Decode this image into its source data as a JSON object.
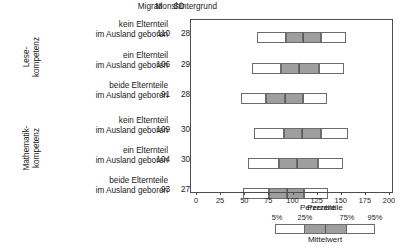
{
  "header": {
    "migration_label": "Migrationshintergrund",
    "m_label": "M",
    "sd_label": "SD"
  },
  "groups": [
    {
      "line1": "Lese-",
      "line2": "kompetenz"
    },
    {
      "line1": "Mathematik-",
      "line2": "kompetenz"
    }
  ],
  "rows": [
    {
      "line1": "kein Elternteil",
      "line2": "im Ausland geboren",
      "M": "110",
      "SD": "28"
    },
    {
      "line1": "ein Elternteil",
      "line2": "im Ausland geboren",
      "M": "106",
      "SD": "29"
    },
    {
      "line1": "beide Elternteile",
      "line2": "im Ausland geboren",
      "M": "91",
      "SD": "28"
    },
    {
      "line1": "kein Elternteil",
      "line2": "im Ausland geboren",
      "M": "109",
      "SD": "30"
    },
    {
      "line1": "ein Elternteil",
      "line2": "im Ausland geboren",
      "M": "104",
      "SD": "30"
    },
    {
      "line1": "beide Elternteile",
      "line2": "im Ausland geboren",
      "M": "93",
      "SD": "27"
    }
  ],
  "axis": {
    "title": "Perzentile",
    "ticks": [
      "0",
      "25",
      "50",
      "75",
      "100",
      "125",
      "150",
      "175",
      "200"
    ],
    "min": 0,
    "max": 200,
    "step": 25
  },
  "legend": {
    "title": "Perzentile",
    "mean_label": "Mittelwert",
    "percentile_labels": [
      "5%",
      "25%",
      "75%",
      "95%"
    ]
  },
  "colors": {
    "outer_fill": "#ffffff",
    "inner_fill": "#9e9e9e",
    "stroke": "#6b6b6b",
    "axis": "#4d4d4d",
    "text": "#1a1a1a"
  },
  "chart_data": {
    "type": "bar",
    "xlabel": "Perzentile",
    "ylabel": "",
    "xlim": [
      0,
      200
    ],
    "xticks": [
      0,
      25,
      50,
      75,
      100,
      125,
      150,
      175,
      200
    ],
    "grid": false,
    "legend": "bottom-right",
    "categories": [
      "Lesekompetenz / kein Elternteil im Ausland geboren",
      "Lesekompetenz / ein Elternteil im Ausland geboren",
      "Lesekompetenz / beide Elternteile im Ausland geboren",
      "Mathematikkompetenz / kein Elternteil im Ausland geboren",
      "Mathematikkompetenz / ein Elternteil im Ausland geboren",
      "Mathematikkompetenz / beide Elternteile im Ausland geboren"
    ],
    "series": [
      {
        "name": "M",
        "values": [
          110,
          106,
          91,
          109,
          104,
          93
        ]
      },
      {
        "name": "SD",
        "values": [
          28,
          29,
          28,
          30,
          30,
          27
        ]
      },
      {
        "name": "p5",
        "values": [
          62,
          57,
          46,
          59,
          53,
          48
        ]
      },
      {
        "name": "p25",
        "values": [
          92,
          87,
          72,
          90,
          85,
          75
        ]
      },
      {
        "name": "p75",
        "values": [
          129,
          126,
          110,
          129,
          125,
          111
        ]
      },
      {
        "name": "p95",
        "values": [
          154,
          152,
          135,
          156,
          151,
          136
        ]
      }
    ],
    "boxes": [
      {
        "p5": 62,
        "p25": 92,
        "mean": 110,
        "p75": 129,
        "p95": 154
      },
      {
        "p5": 57,
        "p25": 87,
        "mean": 106,
        "p75": 126,
        "p95": 152
      },
      {
        "p5": 46,
        "p25": 72,
        "mean": 91,
        "p75": 110,
        "p95": 135
      },
      {
        "p5": 59,
        "p25": 90,
        "mean": 109,
        "p75": 129,
        "p95": 156
      },
      {
        "p5": 53,
        "p25": 85,
        "mean": 104,
        "p75": 125,
        "p95": 151
      },
      {
        "p5": 48,
        "p25": 75,
        "mean": 93,
        "p75": 111,
        "p95": 136
      }
    ]
  }
}
